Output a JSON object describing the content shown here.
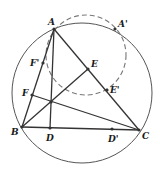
{
  "diagram": {
    "type": "geometry",
    "colors": {
      "stroke": "#333333",
      "circle": "#555555",
      "dashed": "#777777",
      "point": "#333333"
    },
    "circles": [
      {
        "id": "circumcircle",
        "cx": 82,
        "cy": 93,
        "r": 70,
        "style": "solid"
      },
      {
        "id": "dashed-circle",
        "cx": 86,
        "cy": 55,
        "r": 40,
        "style": "dashed"
      }
    ],
    "points": {
      "A": {
        "x": 54,
        "y": 29,
        "label": "A",
        "lx": 48,
        "ly": 25
      },
      "A'": {
        "x": 115,
        "y": 29,
        "label": "A'",
        "lx": 118,
        "ly": 27
      },
      "B": {
        "x": 22,
        "y": 127,
        "label": "B",
        "lx": 11,
        "ly": 135
      },
      "C": {
        "x": 139,
        "y": 130,
        "label": "C",
        "lx": 142,
        "ly": 139
      },
      "D": {
        "x": 50,
        "y": 128,
        "label": "D",
        "lx": 46,
        "ly": 141
      },
      "D'": {
        "x": 112,
        "y": 129,
        "label": "D'",
        "lx": 108,
        "ly": 142
      },
      "E": {
        "x": 88,
        "y": 69,
        "label": "E",
        "lx": 91,
        "ly": 67
      },
      "E'": {
        "x": 107,
        "y": 90,
        "label": "E'",
        "lx": 110,
        "ly": 93
      },
      "F": {
        "x": 32,
        "y": 95,
        "label": "F",
        "lx": 22,
        "ly": 96
      },
      "F'": {
        "x": 43,
        "y": 63,
        "label": "F'",
        "lx": 30,
        "ly": 66
      },
      "H": {
        "x": 51,
        "y": 102,
        "label": "",
        "lx": 0,
        "ly": 0
      }
    },
    "segments": [
      [
        "A",
        "B"
      ],
      [
        "B",
        "C"
      ],
      [
        "C",
        "A"
      ],
      [
        "A",
        "D"
      ],
      [
        "B",
        "E"
      ],
      [
        "C",
        "F"
      ]
    ],
    "dashed_segments": [
      [
        "A",
        "H"
      ]
    ],
    "marked_points": [
      "A",
      "A'",
      "B",
      "C",
      "D",
      "D'",
      "E",
      "E'",
      "F",
      "F'",
      "H"
    ]
  }
}
